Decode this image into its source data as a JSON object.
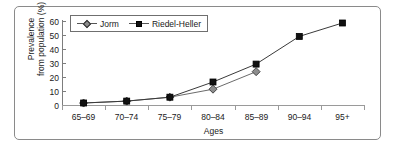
{
  "chart_data": {
    "type": "line",
    "title": "",
    "xlabel": "Ages",
    "ylabel": "Prevalence from population (%)",
    "ylabel_lines": [
      "Prevalence",
      "from population (%)"
    ],
    "categories": [
      "65–69",
      "70–74",
      "75–79",
      "80–84",
      "85–89",
      "90–94",
      "95+"
    ],
    "ylim": [
      0,
      60
    ],
    "ytick_labels": [
      "0",
      "10",
      "20",
      "30",
      "40",
      "50",
      "60"
    ],
    "yticks": [
      0,
      10,
      20,
      30,
      40,
      50,
      60
    ],
    "grid": false,
    "legend_position": "top-left",
    "series": [
      {
        "name": "Jorm",
        "marker": "diamond",
        "color": "#8d8d8d",
        "line_color": "#6b6b6b",
        "values": [
          1.4,
          2.8,
          5.6,
          11.3,
          23.8,
          null,
          null
        ]
      },
      {
        "name": "Riedel-Heller",
        "marker": "square",
        "color": "#111111",
        "line_color": "#3a3a3a",
        "values": [
          1.4,
          2.8,
          5.6,
          16.4,
          29.2,
          49.0,
          58.6
        ]
      }
    ]
  },
  "legend": {
    "entries": [
      {
        "label": "Jorm",
        "icon": "diamond-marker"
      },
      {
        "label": "Riedel-Heller",
        "icon": "square-marker"
      }
    ]
  },
  "axes": {
    "x_title": "Ages",
    "y_title_line1": "Prevalence",
    "y_title_line2": "from population (%)",
    "x_categories": [
      "65–69",
      "70–74",
      "75–79",
      "80–84",
      "85–89",
      "90–94",
      "95+"
    ],
    "y_labels": [
      "60",
      "50",
      "40",
      "30",
      "20",
      "10",
      "0"
    ]
  },
  "colors": {
    "frame": "#8a8a8a",
    "axis": "#7d7d7d",
    "series_jorm": "#8d8d8d",
    "series_riedel": "#111111",
    "background": "#ffffff"
  }
}
